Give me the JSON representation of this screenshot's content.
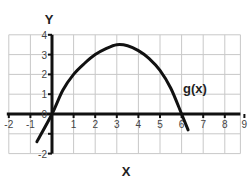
{
  "chart_data": {
    "type": "line",
    "title": "",
    "xlabel": "X",
    "ylabel": "Y",
    "xlim": [
      -2,
      9
    ],
    "ylim": [
      -2,
      4
    ],
    "grid": true,
    "x_ticks": [
      -2,
      -1,
      0,
      1,
      2,
      3,
      4,
      5,
      6,
      7,
      8,
      9
    ],
    "x_tick_labels": [
      "-2",
      "-1",
      "0",
      "1",
      "2",
      "3",
      "4",
      "5",
      "6",
      "7",
      "8",
      "9"
    ],
    "y_ticks": [
      -2,
      -1,
      0,
      1,
      2,
      3,
      4
    ],
    "y_tick_labels": [
      "-2",
      "",
      "0",
      "1",
      "2",
      "3",
      "4"
    ],
    "series": [
      {
        "name": "g(x)",
        "x": [
          -0.7,
          0,
          0.5,
          1,
          1.5,
          2,
          2.5,
          3,
          3.5,
          4,
          4.5,
          5,
          5.5,
          6,
          6.3
        ],
        "values": [
          -1.4,
          0,
          1.2,
          2.0,
          2.55,
          3.0,
          3.3,
          3.5,
          3.45,
          3.2,
          2.8,
          2.2,
          1.3,
          0,
          -0.8
        ]
      }
    ],
    "annotations": [
      {
        "text": "g(x)",
        "x": 6.1,
        "y": 1.4
      }
    ],
    "colors": {
      "curve": "#111111",
      "axis": "#111111",
      "grid": "#c8c8c8"
    }
  }
}
